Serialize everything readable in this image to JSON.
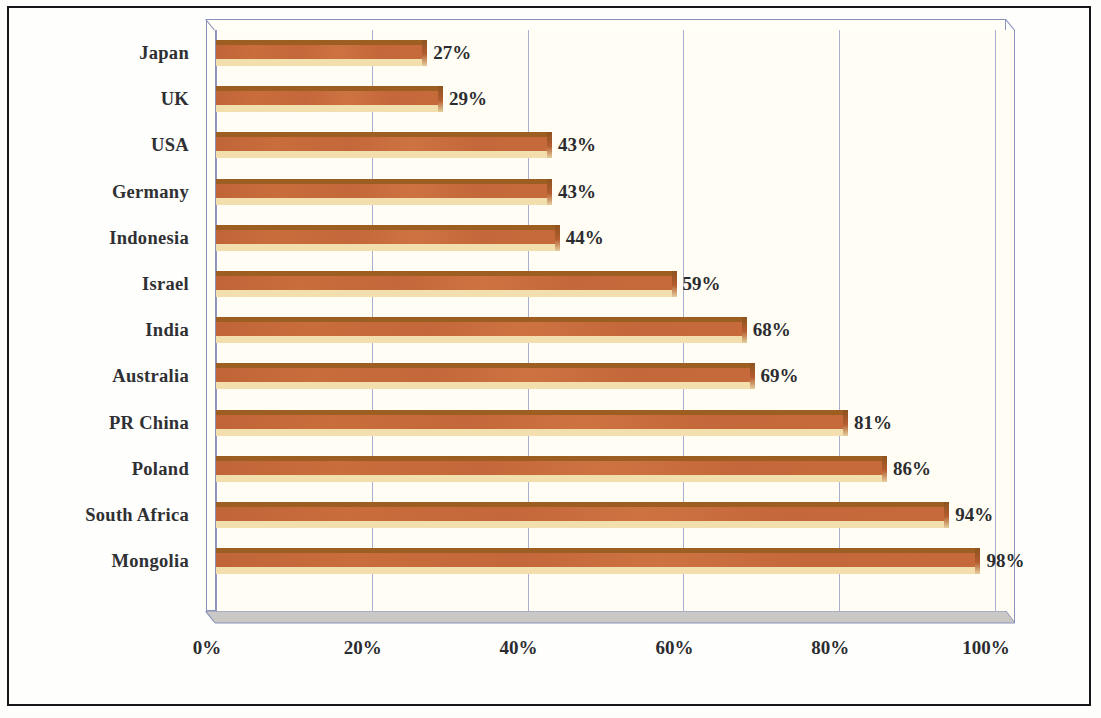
{
  "chart_data": {
    "type": "bar",
    "orientation": "horizontal",
    "title": "",
    "subtitle": "",
    "xlabel": "",
    "ylabel": "",
    "categories": [
      "Japan",
      "UK",
      "USA",
      "Germany",
      "Indonesia",
      "Israel",
      "India",
      "Australia",
      "PR China",
      "Poland",
      "South Africa",
      "Mongolia"
    ],
    "values": [
      27,
      29,
      43,
      43,
      44,
      59,
      68,
      69,
      81,
      86,
      94,
      98
    ],
    "value_labels": [
      "27%",
      "29%",
      "43%",
      "43%",
      "44%",
      "59%",
      "68%",
      "69%",
      "81%",
      "86%",
      "94%",
      "98%"
    ],
    "xlim": [
      0,
      100
    ],
    "x_ticks": [
      0,
      20,
      40,
      60,
      80,
      100
    ],
    "x_tick_labels": [
      "0%",
      "20%",
      "40%",
      "60%",
      "80%",
      "100%"
    ],
    "grid": true,
    "grid_axis": "x",
    "legend": null,
    "series": [
      {
        "name": "Percentage",
        "values": [
          27,
          29,
          43,
          43,
          44,
          59,
          68,
          69,
          81,
          86,
          94,
          98
        ]
      }
    ]
  },
  "style": {
    "bar_color": "#c4673a",
    "bar_top_color": "#9d5e21",
    "bar_bottom_color": "#f3dfae",
    "grid_color": "#9298c2",
    "plot_bg": "#fffdf4",
    "floor_color": "#c9c8c4",
    "frame_color": "#15161a",
    "text_color": "#2b2c2f"
  }
}
